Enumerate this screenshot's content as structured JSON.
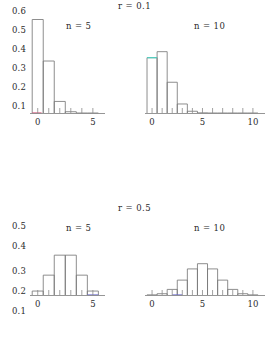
{
  "figure": {
    "width": 269,
    "height": 364,
    "background": "#ffffff",
    "axis_color": "#8a8a8a",
    "bar_stroke_color": "#7a7a7a",
    "text_color": "#2b2b2b"
  },
  "rows": [
    {
      "title": "r = 0.1",
      "y_ticks": [
        "0.6",
        "0.5",
        "0.4",
        "0.3",
        "0.2",
        "0.1"
      ],
      "y_values": [
        0.6,
        0.5,
        0.4,
        0.3,
        0.2,
        0.1
      ],
      "ylim": [
        0.0,
        0.65
      ],
      "panels": [
        {
          "caption": "n = 5",
          "x_ticks": [
            "0",
            "5"
          ],
          "x_values": [
            0,
            5
          ],
          "xlim": [
            -0.7,
            6.1
          ],
          "accent_color": "#d4547a"
        },
        {
          "caption": "n = 10",
          "x_ticks": [
            "0",
            "5",
            "10"
          ],
          "x_values": [
            0,
            5,
            10
          ],
          "xlim": [
            -0.7,
            11.2
          ],
          "accent_color": "#4fd0c0"
        }
      ]
    },
    {
      "title": "r = 0.5",
      "y_ticks": [
        "0.5",
        "0.4",
        "0.3",
        "0.2",
        "0.1"
      ],
      "y_values": [
        0.5,
        0.4,
        0.3,
        0.2,
        0.1
      ],
      "ylim": [
        0.0,
        0.55
      ],
      "panels": [
        {
          "caption": "n = 5",
          "x_ticks": [
            "0",
            "5"
          ],
          "x_values": [
            0,
            5
          ],
          "xlim": [
            -0.7,
            6.1
          ],
          "accent_color": "#6a6ad0"
        },
        {
          "caption": "n = 10",
          "x_ticks": [
            "0",
            "5",
            "10"
          ],
          "x_values": [
            0,
            5,
            10
          ],
          "xlim": [
            -0.7,
            11.2
          ],
          "accent_color": "#6a6ad0"
        }
      ]
    }
  ],
  "chart_data": [
    {
      "type": "bar",
      "title": "r = 0.1",
      "subtitle": "n = 5",
      "panel": "top-left",
      "xlabel": "",
      "ylabel": "",
      "categories": [
        "0",
        "1",
        "2",
        "3",
        "4",
        "5"
      ],
      "x": [
        0,
        1,
        2,
        3,
        4,
        5
      ],
      "values": [
        0.59,
        0.328,
        0.073,
        0.008,
        0.0,
        0.0
      ],
      "xlim": [
        -0.7,
        6.1
      ],
      "ylim": [
        0,
        0.65
      ],
      "xticks": [
        0,
        5
      ],
      "yticks": [
        0.1,
        0.2,
        0.3,
        0.4,
        0.5,
        0.6
      ],
      "grid": false,
      "legend": "none"
    },
    {
      "type": "bar",
      "title": "r = 0.1",
      "subtitle": "n = 10",
      "panel": "top-right",
      "xlabel": "",
      "ylabel": "",
      "categories": [
        "0",
        "1",
        "2",
        "3",
        "4",
        "5",
        "6",
        "7",
        "8",
        "9",
        "10"
      ],
      "x": [
        0,
        1,
        2,
        3,
        4,
        5,
        6,
        7,
        8,
        9,
        10
      ],
      "values": [
        0.349,
        0.387,
        0.194,
        0.057,
        0.011,
        0.001,
        0.0,
        0.0,
        0.0,
        0.0,
        0.0
      ],
      "xlim": [
        -0.7,
        11.2
      ],
      "ylim": [
        0,
        0.65
      ],
      "xticks": [
        0,
        5,
        10
      ],
      "yticks": [
        0.1,
        0.2,
        0.3,
        0.4,
        0.5,
        0.6
      ],
      "grid": false,
      "legend": "none"
    },
    {
      "type": "bar",
      "title": "r = 0.5",
      "subtitle": "n = 5",
      "panel": "bottom-left",
      "xlabel": "",
      "ylabel": "",
      "categories": [
        "0",
        "1",
        "2",
        "3",
        "4",
        "5"
      ],
      "x": [
        0,
        1,
        2,
        3,
        4,
        5
      ],
      "values": [
        0.031,
        0.156,
        0.313,
        0.313,
        0.156,
        0.031
      ],
      "xlim": [
        -0.7,
        6.1
      ],
      "ylim": [
        0,
        0.55
      ],
      "xticks": [
        0,
        5
      ],
      "yticks": [
        0.1,
        0.2,
        0.3,
        0.4,
        0.5
      ],
      "grid": false,
      "legend": "none"
    },
    {
      "type": "bar",
      "title": "r = 0.5",
      "subtitle": "n = 10",
      "panel": "bottom-right",
      "xlabel": "",
      "ylabel": "",
      "categories": [
        "0",
        "1",
        "2",
        "3",
        "4",
        "5",
        "6",
        "7",
        "8",
        "9",
        "10"
      ],
      "x": [
        0,
        1,
        2,
        3,
        4,
        5,
        6,
        7,
        8,
        9,
        10
      ],
      "values": [
        0.001,
        0.01,
        0.044,
        0.117,
        0.205,
        0.246,
        0.205,
        0.117,
        0.044,
        0.01,
        0.001
      ],
      "xlim": [
        -0.7,
        11.2
      ],
      "ylim": [
        0,
        0.55
      ],
      "xticks": [
        0,
        5,
        10
      ],
      "yticks": [
        0.1,
        0.2,
        0.3,
        0.4,
        0.5
      ],
      "grid": false,
      "legend": "none"
    }
  ]
}
